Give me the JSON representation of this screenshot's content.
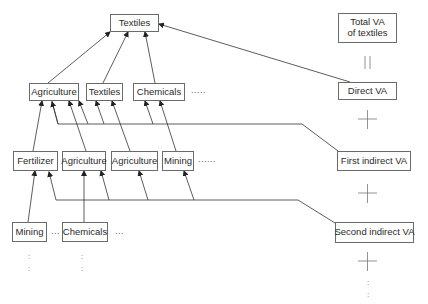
{
  "diagram": {
    "top": {
      "label": "Textiles"
    },
    "level1": [
      {
        "label": "Agriculture"
      },
      {
        "label": "Textiles"
      },
      {
        "label": "Chemicals"
      }
    ],
    "level1_ellipsis": ".....",
    "level2": [
      {
        "label": "Fertilizer"
      },
      {
        "label": "Agriculture"
      },
      {
        "label": "Agriculture"
      },
      {
        "label": "Mining"
      }
    ],
    "level2_ellipsis": "......",
    "level3": [
      {
        "label": "Mining"
      },
      {
        "label": "Chemicals"
      }
    ],
    "level3_ellipsis_mid": "...",
    "level3_ellipsis_end": "...",
    "vertical_ellipsis": ":\n:",
    "right_column": {
      "total": "Total VA\nof textiles",
      "equals": "||",
      "direct": "Direct VA",
      "plus": "+",
      "first_indirect": "First indirect VA",
      "second_indirect": "Second indirect VA"
    },
    "colors": {
      "line": "#333333",
      "box_border": "#6a6a6a",
      "text": "#2a2a2a"
    }
  }
}
